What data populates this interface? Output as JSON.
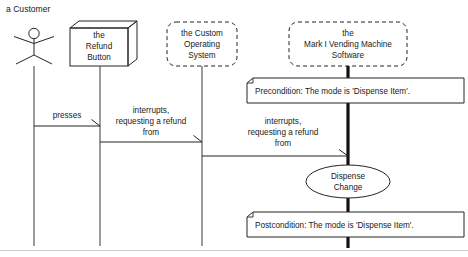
{
  "diagram": {
    "kind": "uml-sequence-diagram",
    "title": "",
    "background_color": "#ffffff",
    "line_color": "#242424"
  },
  "actor": {
    "label": "a Customer",
    "icon": "stick-figure-actor"
  },
  "participants": [
    {
      "id": "refund-button",
      "shape": "node-3d-box",
      "lines": [
        "the",
        "Refund",
        "Button"
      ]
    },
    {
      "id": "custom-operating-system",
      "shape": "dashed-rounded-rect",
      "lines": [
        "the Custom",
        "Operating",
        "System"
      ]
    },
    {
      "id": "vending-machine-software",
      "shape": "dashed-rounded-rect",
      "lines": [
        "the",
        "Mark I Vending Machine",
        "Software"
      ]
    }
  ],
  "messages": [
    {
      "id": "presses",
      "lines": [
        "presses"
      ],
      "from": "a Customer",
      "to": "the Refund Button"
    },
    {
      "id": "interrupts-refund-os",
      "lines": [
        "interrupts,",
        "requesting a refund",
        "from"
      ],
      "from": "the Refund Button",
      "to": "the Custom Operating System"
    },
    {
      "id": "interrupts-refund-software",
      "lines": [
        "interrupts,",
        "requesting a refund",
        "from"
      ],
      "from": "the Custom Operating System",
      "to": "the Mark I Vending Machine Software"
    }
  ],
  "notes": [
    {
      "id": "precondition-note",
      "text": "Precondition: The mode is 'Dispense Item'."
    },
    {
      "id": "postcondition-note",
      "text": "Postcondition: The mode is 'Dispense Item'."
    }
  ],
  "action": {
    "id": "dispense-change",
    "shape": "ellipse",
    "lines": [
      "Dispense",
      "Change"
    ]
  }
}
